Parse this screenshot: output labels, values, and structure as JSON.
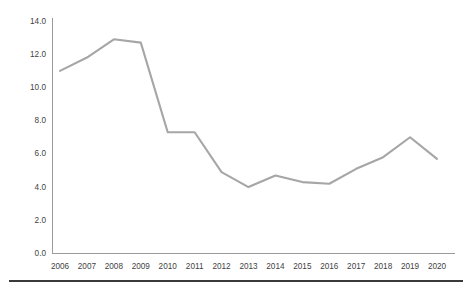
{
  "chart_data": {
    "type": "line",
    "title": "",
    "subtitle": "",
    "xlabel": "",
    "ylabel": "",
    "categories": [
      "2006",
      "2007",
      "2008",
      "2009",
      "2010",
      "2011",
      "2012",
      "2013",
      "2014",
      "2015",
      "2016",
      "2017",
      "2018",
      "2019",
      "2020"
    ],
    "values": [
      11.0,
      11.8,
      12.9,
      12.7,
      7.3,
      7.3,
      4.9,
      4.0,
      4.7,
      4.3,
      4.2,
      5.1,
      5.8,
      7.0,
      5.7
    ],
    "series": [
      {
        "name": "",
        "values": [
          11.0,
          11.8,
          12.9,
          12.7,
          7.3,
          7.3,
          4.9,
          4.0,
          4.7,
          4.3,
          4.2,
          5.1,
          5.8,
          7.0,
          5.7
        ],
        "color": "#a6a6a6"
      }
    ],
    "ylim": [
      0.0,
      14.0
    ],
    "y_ticks": [
      0.0,
      2.0,
      4.0,
      6.0,
      8.0,
      10.0,
      12.0,
      14.0
    ],
    "y_tick_labels": [
      "0.0",
      "2.0",
      "4.0",
      "6.0",
      "8.0",
      "10.0",
      "12.0",
      "14.0"
    ],
    "x_tick_labels": [
      "2006",
      "2007",
      "2008",
      "2009",
      "2010",
      "2011",
      "2012",
      "2013",
      "2014",
      "2015",
      "2016",
      "2017",
      "2018",
      "2019",
      "2020"
    ],
    "grid": false,
    "legend": false,
    "legend_position": "none",
    "markers": false,
    "annotations": [],
    "colors": {
      "line": "#a6a6a6",
      "axis": "#9b9b9b",
      "tick_text": "#3f3f3f",
      "background": "#ffffff",
      "footer_rule": "#3a3a3a"
    }
  }
}
